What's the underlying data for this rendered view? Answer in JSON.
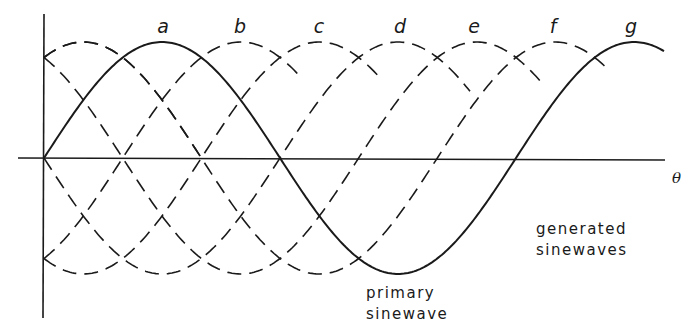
{
  "diagram": {
    "title": "",
    "axis": {
      "x_label": "θ"
    },
    "phase_labels": [
      {
        "text": "a",
        "x": 163
      },
      {
        "text": "b",
        "x": 240
      },
      {
        "text": "c",
        "x": 319
      },
      {
        "text": "d",
        "x": 400
      },
      {
        "text": "e",
        "x": 474
      },
      {
        "text": "f",
        "x": 553
      },
      {
        "text": "g",
        "x": 631
      }
    ],
    "annotations": {
      "primary": {
        "line1": "primary",
        "line2": "sinewave"
      },
      "generated": {
        "line1": "generated",
        "line2": "sinewaves"
      }
    },
    "geometry": {
      "origin_x": 44,
      "axis_y": 158,
      "amplitude": 116,
      "period_px": 472,
      "x_axis_start": 18,
      "x_axis_end": 665,
      "y_axis_top": 14,
      "y_axis_bottom": 318
    },
    "primary_wave": {
      "style": "solid",
      "phase_deg": 0,
      "x_start": 44,
      "x_end": 665
    },
    "generated_waves": [
      {
        "style": "dashed",
        "phase_deg": -60,
        "x_start": 44,
        "x_end": 200
      },
      {
        "style": "dashed",
        "phase_deg": 60,
        "x_start": 44,
        "x_end": 300
      },
      {
        "style": "dashed",
        "phase_deg": 120,
        "x_start": 44,
        "x_end": 380
      },
      {
        "style": "dashed",
        "phase_deg": 180,
        "x_start": 44,
        "x_end": 470
      },
      {
        "style": "dashed",
        "phase_deg": 240,
        "x_start": 44,
        "x_end": 545
      },
      {
        "style": "dashed",
        "phase_deg": 300,
        "x_start": 44,
        "x_end": 610
      },
      {
        "style": "dashed",
        "phase_deg": 120,
        "x_start": 380,
        "x_end": 632
      },
      {
        "style": "dashed",
        "phase_deg": 180,
        "x_start": 470,
        "x_end": 580
      },
      {
        "style": "dashed",
        "phase_deg": 240,
        "x_start": 545,
        "x_end": 570
      },
      {
        "style": "dashed",
        "phase_deg": 300,
        "x_start": 610,
        "x_end": 636
      },
      {
        "style": "dashed",
        "phase_deg": -60,
        "x_start": 200,
        "x_end": 590
      }
    ]
  },
  "colors": {
    "ink": "#1a1a1a",
    "background": "#ffffff"
  }
}
